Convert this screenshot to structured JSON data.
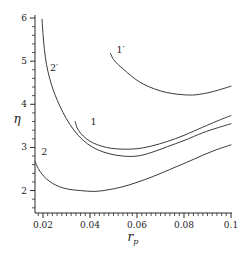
{
  "figure": {
    "background": "#ffffff",
    "ink_color": "#3a3a3a",
    "axis_color": "#2b2b2b"
  },
  "chart_data": {
    "type": "line",
    "title": "",
    "xlabel": "r_p",
    "xlabel_base": "r",
    "xlabel_subscript": "p",
    "ylabel": "η",
    "grid": false,
    "legend_position": "inline-curve-labels",
    "x_axis": {
      "range": [
        0.0166,
        0.1
      ],
      "ticks": [
        0.02,
        0.04,
        0.06,
        0.08,
        0.1
      ],
      "tick_labels": [
        "0.02",
        "0.04",
        "0.06",
        "0.08",
        "0.1"
      ],
      "minor_start": 0.018,
      "minor_step": 0.002
    },
    "y_axis": {
      "range": [
        1.48,
        6.07
      ],
      "ticks": [
        2,
        3,
        4,
        5,
        6
      ],
      "tick_labels": [
        "2",
        "3",
        "4",
        "5",
        "6"
      ],
      "minor_start": 1.6,
      "minor_step": 0.2
    },
    "series": [
      {
        "name": "curve-1-prime",
        "label": "1′",
        "label_pos": [
          0.053,
          5.25
        ],
        "points": [
          [
            0.0487,
            5.18
          ],
          [
            0.05,
            5.04
          ],
          [
            0.052,
            4.92
          ],
          [
            0.0545,
            4.8
          ],
          [
            0.0575,
            4.66
          ],
          [
            0.061,
            4.52
          ],
          [
            0.065,
            4.41
          ],
          [
            0.07,
            4.31
          ],
          [
            0.075,
            4.25
          ],
          [
            0.08,
            4.22
          ],
          [
            0.085,
            4.22
          ],
          [
            0.092,
            4.29
          ],
          [
            0.1,
            4.42
          ]
        ]
      },
      {
        "name": "curve-2-prime",
        "label": "2′",
        "label_pos": [
          0.0247,
          4.85
        ],
        "points": [
          [
            0.0196,
            5.97
          ],
          [
            0.02,
            5.62
          ],
          [
            0.0206,
            5.27
          ],
          [
            0.0215,
            4.92
          ],
          [
            0.0228,
            4.61
          ],
          [
            0.0243,
            4.34
          ],
          [
            0.0262,
            4.08
          ],
          [
            0.0285,
            3.81
          ],
          [
            0.0315,
            3.53
          ],
          [
            0.035,
            3.28
          ],
          [
            0.039,
            3.08
          ],
          [
            0.0435,
            2.94
          ],
          [
            0.0485,
            2.85
          ],
          [
            0.054,
            2.8
          ],
          [
            0.06,
            2.8
          ],
          [
            0.066,
            2.88
          ],
          [
            0.073,
            3.02
          ],
          [
            0.08,
            3.16
          ],
          [
            0.088,
            3.34
          ],
          [
            0.094,
            3.45
          ],
          [
            0.1,
            3.55
          ]
        ]
      },
      {
        "name": "curve-1",
        "label": "1",
        "label_pos": [
          0.0415,
          3.59
        ],
        "points": [
          [
            0.0337,
            3.6
          ],
          [
            0.0345,
            3.46
          ],
          [
            0.036,
            3.33
          ],
          [
            0.0385,
            3.2
          ],
          [
            0.0415,
            3.1
          ],
          [
            0.045,
            3.03
          ],
          [
            0.049,
            2.98
          ],
          [
            0.054,
            2.96
          ],
          [
            0.06,
            2.97
          ],
          [
            0.066,
            3.03
          ],
          [
            0.073,
            3.14
          ],
          [
            0.08,
            3.28
          ],
          [
            0.088,
            3.47
          ],
          [
            0.094,
            3.61
          ],
          [
            0.1,
            3.74
          ]
        ]
      },
      {
        "name": "curve-2",
        "label": "2",
        "label_pos": [
          0.0205,
          2.9
        ],
        "points": [
          [
            0.0166,
            2.68
          ],
          [
            0.018,
            2.51
          ],
          [
            0.0196,
            2.38
          ],
          [
            0.0215,
            2.27
          ],
          [
            0.024,
            2.17
          ],
          [
            0.027,
            2.09
          ],
          [
            0.031,
            2.03
          ],
          [
            0.036,
            2.0
          ],
          [
            0.042,
            1.98
          ],
          [
            0.048,
            2.02
          ],
          [
            0.054,
            2.09
          ],
          [
            0.06,
            2.19
          ],
          [
            0.067,
            2.33
          ],
          [
            0.074,
            2.49
          ],
          [
            0.081,
            2.65
          ],
          [
            0.088,
            2.82
          ],
          [
            0.094,
            2.95
          ],
          [
            0.1,
            3.06
          ]
        ]
      }
    ]
  }
}
